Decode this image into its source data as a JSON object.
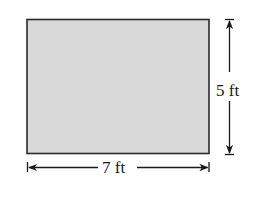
{
  "figure": {
    "type": "rectangle",
    "fill_color": "#d9d9d9",
    "stroke_color": "#2a2a2a"
  },
  "dimensions": {
    "height": {
      "label": "5 ft",
      "value": 5,
      "unit": "ft"
    },
    "width": {
      "label": "7 ft",
      "value": 7,
      "unit": "ft"
    }
  }
}
